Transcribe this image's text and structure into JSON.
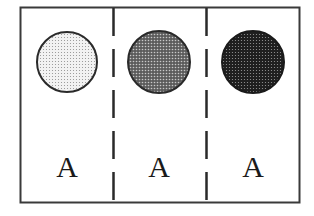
{
  "figure": {
    "border_color": "#3a3a3a",
    "panels": [
      {
        "label": "A",
        "circle_shade": "light",
        "circle_fill": "#e9e9e9",
        "dot_color": "#9a9a9a"
      },
      {
        "label": "A",
        "circle_shade": "medium",
        "circle_fill": "#8a8a8a",
        "dot_color": "#3c3c3c"
      },
      {
        "label": "A",
        "circle_shade": "dark",
        "circle_fill": "#2e2e2e",
        "dot_color": "#7a7a7a"
      }
    ]
  }
}
